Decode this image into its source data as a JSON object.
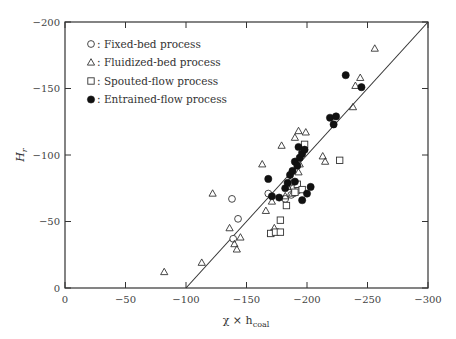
{
  "chart_data": {
    "type": "scatter",
    "title": "",
    "xlabel": "χ × h_coal",
    "xlabel_main": "χ × h",
    "xlabel_sub": "coal",
    "ylabel": "H_r",
    "ylabel_main": "H",
    "ylabel_sub": "r",
    "xlim": [
      0,
      -300
    ],
    "ylim": [
      0,
      -200
    ],
    "x_ticks": [
      0,
      -50,
      -100,
      -150,
      -200,
      -250,
      -300
    ],
    "y_ticks": [
      0,
      -50,
      -100,
      -150,
      -200
    ],
    "grid": false,
    "legend_position": "upper-left",
    "legend": [
      {
        "marker": "circle-open",
        "label": "Fixed-bed process"
      },
      {
        "marker": "triangle-open",
        "label": "Fluidized-bed process"
      },
      {
        "marker": "square-open",
        "label": "Spouted-flow process"
      },
      {
        "marker": "circle-filled",
        "label": "Entrained-flow process"
      }
    ],
    "fit_line": {
      "x": [
        -100,
        -300
      ],
      "y": [
        0,
        -200
      ]
    },
    "series": [
      {
        "name": "Fixed-bed process",
        "marker": "circle-open",
        "points": [
          [
            -138,
            -67
          ],
          [
            -143,
            -52
          ],
          [
            -139,
            -37
          ],
          [
            -168,
            -71
          ],
          [
            -182,
            -67
          ],
          [
            -189,
            -75
          ],
          [
            -192,
            -73
          ],
          [
            -187,
            -70
          ]
        ]
      },
      {
        "name": "Fluidized-bed process",
        "marker": "triangle-open",
        "points": [
          [
            -82,
            -12
          ],
          [
            -113,
            -19
          ],
          [
            -122,
            -71
          ],
          [
            -136,
            -45
          ],
          [
            -140,
            -33
          ],
          [
            -142,
            -29
          ],
          [
            -145,
            -38
          ],
          [
            -163,
            -93
          ],
          [
            -166,
            -58
          ],
          [
            -171,
            -65
          ],
          [
            -173,
            -45
          ],
          [
            -170,
            -41
          ],
          [
            -179,
            -107
          ],
          [
            -182,
            -69
          ],
          [
            -184,
            -76
          ],
          [
            -186,
            -80
          ],
          [
            -188,
            -71
          ],
          [
            -190,
            -113
          ],
          [
            -193,
            -118
          ],
          [
            -196,
            -104
          ],
          [
            -199,
            -117
          ],
          [
            -193,
            -87
          ],
          [
            -194,
            -93
          ],
          [
            -213,
            -99
          ],
          [
            -215,
            -95
          ],
          [
            -238,
            -136
          ],
          [
            -240,
            -152
          ],
          [
            -244,
            -158
          ],
          [
            -256,
            -180
          ]
        ]
      },
      {
        "name": "Spouted-flow process",
        "marker": "square-open",
        "points": [
          [
            -170,
            -41
          ],
          [
            -174,
            -42
          ],
          [
            -178,
            -42
          ],
          [
            -178,
            -51
          ],
          [
            -183,
            -62
          ],
          [
            -190,
            -72
          ],
          [
            -192,
            -78
          ],
          [
            -196,
            -74
          ],
          [
            -198,
            -108
          ],
          [
            -227,
            -96
          ]
        ]
      },
      {
        "name": "Entrained-flow process",
        "marker": "circle-filled",
        "points": [
          [
            -168,
            -82
          ],
          [
            -171,
            -69
          ],
          [
            -177,
            -68
          ],
          [
            -182,
            -75
          ],
          [
            -184,
            -79
          ],
          [
            -186,
            -85
          ],
          [
            -188,
            -88
          ],
          [
            -190,
            -95
          ],
          [
            -192,
            -92
          ],
          [
            -194,
            -98
          ],
          [
            -196,
            -101
          ],
          [
            -190,
            -80
          ],
          [
            -198,
            -104
          ],
          [
            -203,
            -76
          ],
          [
            -196,
            -66
          ],
          [
            -200,
            -71
          ],
          [
            -219,
            -128
          ],
          [
            -224,
            -129
          ],
          [
            -222,
            -123
          ],
          [
            -232,
            -160
          ],
          [
            -245,
            -151
          ],
          [
            -193,
            -106
          ]
        ]
      }
    ]
  }
}
